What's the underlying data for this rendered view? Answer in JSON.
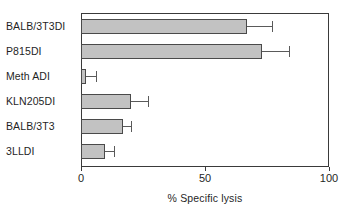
{
  "chart_data": {
    "type": "bar",
    "orientation": "horizontal",
    "title": "",
    "xlabel": "% Specific lysis",
    "ylabel": "",
    "xlim": [
      0,
      100
    ],
    "xticks": [
      0,
      50,
      100
    ],
    "xtick_labels": [
      "0",
      "50",
      "100"
    ],
    "grid": false,
    "legend": null,
    "bar_color": "#c2c2c2",
    "bar_edge_color": "#4a4a4a",
    "axis_color": "#3a3a3a",
    "error_bar_color": "#5a5a5a",
    "categories": [
      "BALB/3T3DI",
      "P815DI",
      "Meth ADI",
      "KLN205DI",
      "BALB/3T3",
      "3LLDI"
    ],
    "values": [
      67,
      73,
      2,
      20,
      17,
      9.5
    ],
    "errors": [
      10,
      11,
      4,
      7,
      3,
      4
    ],
    "points": [
      {
        "category": "BALB/3T3DI",
        "value": 67,
        "error": 10,
        "error_high": 77
      },
      {
        "category": "P815DI",
        "value": 73,
        "error": 11,
        "error_high": 84
      },
      {
        "category": "Meth ADI",
        "value": 2,
        "error": 4,
        "error_high": 6
      },
      {
        "category": "KLN205DI",
        "value": 20,
        "error": 7,
        "error_high": 27
      },
      {
        "category": "BALB/3T3",
        "value": 17,
        "error": 3,
        "error_high": 20
      },
      {
        "category": "3LLDI",
        "value": 9.5,
        "error": 4,
        "error_high": 13.5
      }
    ]
  }
}
